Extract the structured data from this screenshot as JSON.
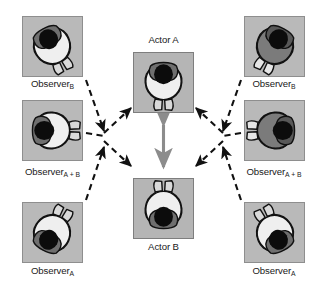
{
  "diagram": {
    "colors": {
      "panel_fill": "#b9b9b9",
      "panel_border": "#8e8e8e",
      "dashed_arrow": "#111111",
      "center_arrow": "#8c8c8c",
      "body_light": "#efefef",
      "body_mid": "#c9c9c9",
      "body_dark": "#6d6d6d",
      "head_dark": "#101010",
      "outline": "#111111",
      "background": "#ffffff"
    },
    "panels": [
      {
        "id": "observer-b-left",
        "label": "Observer",
        "sub": "B",
        "label_pos": "below",
        "x": 22,
        "y": 16,
        "w": 61,
        "h": 61,
        "tone": "light",
        "rot": -28
      },
      {
        "id": "observer-ab-left",
        "label": "Observer",
        "sub": "A + B",
        "label_pos": "below",
        "x": 22,
        "y": 100,
        "w": 61,
        "h": 61,
        "tone": "light",
        "rot": -90
      },
      {
        "id": "observer-a-left",
        "label": "Observer",
        "sub": "A",
        "label_pos": "below",
        "x": 22,
        "y": 202,
        "w": 61,
        "h": 61,
        "tone": "light",
        "rot": -152
      },
      {
        "id": "actor-a",
        "label": "Actor A",
        "sub": "",
        "label_pos": "above",
        "x": 133,
        "y": 52,
        "w": 61,
        "h": 61,
        "tone": "light",
        "rot": 0
      },
      {
        "id": "actor-b",
        "label": "Actor B",
        "sub": "",
        "label_pos": "below",
        "x": 133,
        "y": 178,
        "w": 61,
        "h": 61,
        "tone": "light",
        "rot": 180
      },
      {
        "id": "observer-b-right",
        "label": "Observer",
        "sub": "B",
        "label_pos": "below",
        "x": 244,
        "y": 16,
        "w": 61,
        "h": 61,
        "tone": "dark",
        "rot": 28
      },
      {
        "id": "observer-ab-right",
        "label": "Observer",
        "sub": "A + B",
        "label_pos": "below",
        "x": 244,
        "y": 100,
        "w": 61,
        "h": 61,
        "tone": "dark",
        "rot": 90
      },
      {
        "id": "observer-a-right",
        "label": "Observer",
        "sub": "A",
        "label_pos": "below",
        "x": 244,
        "y": 202,
        "w": 61,
        "h": 61,
        "tone": "light",
        "rot": 152
      }
    ],
    "labels": {
      "observer_b_left": {
        "text": "Observer",
        "sub": "B",
        "x": 52,
        "y": 83,
        "align": "center"
      },
      "observer_ab_left": {
        "text": "Observer",
        "sub": "A + B",
        "x": 52,
        "y": 174,
        "align": "center"
      },
      "observer_a_left": {
        "text": "Observer",
        "sub": "A",
        "x": 52,
        "y": 270,
        "align": "center"
      },
      "actor_a": {
        "text": "Actor A",
        "sub": "",
        "x": 163,
        "y": 38,
        "align": "center"
      },
      "actor_b": {
        "text": "Actor B",
        "sub": "",
        "x": 163,
        "y": 245,
        "align": "center"
      },
      "observer_b_right": {
        "text": "Observer",
        "sub": "B",
        "x": 274,
        "y": 83,
        "align": "center"
      },
      "observer_ab_right": {
        "text": "Observer",
        "sub": "A + B",
        "x": 274,
        "y": 174,
        "align": "center"
      },
      "observer_a_right": {
        "text": "Observer",
        "sub": "A",
        "x": 274,
        "y": 270,
        "align": "center"
      }
    },
    "hubs": {
      "left": {
        "x": 107,
        "y": 137
      },
      "right": {
        "x": 220,
        "y": 137
      }
    },
    "connections": [
      {
        "id": "link-ob-left-to-hub",
        "from": "observer-b-left",
        "to": "hub-left",
        "style": "dashed",
        "arrow": "end"
      },
      {
        "id": "link-oab-left-to-hub",
        "from": "observer-ab-left",
        "to": "hub-left",
        "style": "dashed",
        "arrow": "none"
      },
      {
        "id": "link-oa-left-to-hub",
        "from": "observer-a-left",
        "to": "hub-left",
        "style": "dashed",
        "arrow": "end"
      },
      {
        "id": "link-hub-left-actor-a",
        "from": "hub-left",
        "to": "actor-a",
        "style": "dashed",
        "arrow": "end"
      },
      {
        "id": "link-hub-left-actor-b",
        "from": "hub-left",
        "to": "actor-b",
        "style": "dashed",
        "arrow": "end"
      },
      {
        "id": "link-ob-right-to-hub",
        "from": "observer-b-right",
        "to": "hub-right",
        "style": "dashed",
        "arrow": "end"
      },
      {
        "id": "link-oab-right-to-hub",
        "from": "observer-ab-right",
        "to": "hub-right",
        "style": "dashed",
        "arrow": "none"
      },
      {
        "id": "link-oa-right-to-hub",
        "from": "observer-a-right",
        "to": "hub-right",
        "style": "dashed",
        "arrow": "end"
      },
      {
        "id": "link-hub-right-actor-a",
        "from": "hub-right",
        "to": "actor-a",
        "style": "dashed",
        "arrow": "end"
      },
      {
        "id": "link-hub-right-actor-b",
        "from": "hub-right",
        "to": "actor-b",
        "style": "dashed",
        "arrow": "end"
      },
      {
        "id": "link-actor-a-actor-b",
        "from": "actor-a",
        "to": "actor-b",
        "style": "solid",
        "arrow": "both"
      }
    ]
  }
}
